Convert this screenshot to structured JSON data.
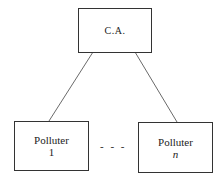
{
  "diagram": {
    "type": "hierarchy",
    "nodes": [
      {
        "id": "ca",
        "label": "C.A."
      },
      {
        "id": "p1",
        "label": "Polluter",
        "sub": "1"
      },
      {
        "id": "pn",
        "label": "Polluter",
        "sub": "n"
      }
    ],
    "edges": [
      [
        "ca",
        "p1"
      ],
      [
        "ca",
        "pn"
      ]
    ],
    "ellipsis": "- - -"
  }
}
